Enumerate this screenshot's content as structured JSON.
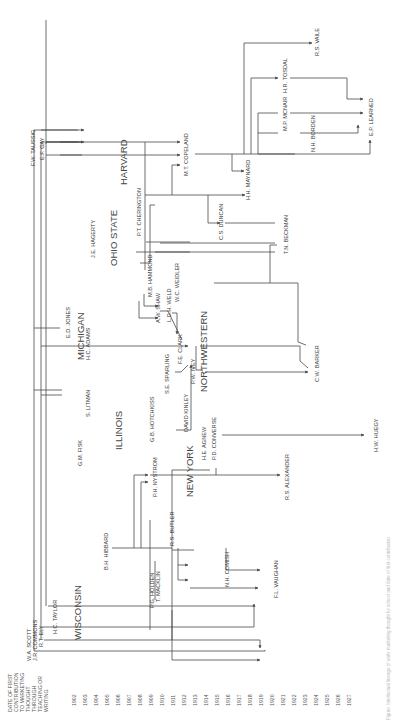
{
  "axis": {
    "heading": [
      "DATE OF FIRST",
      "CONTRIBUTION",
      "TO MARKETING",
      "THOUGHT",
      "THROUGH",
      "TEACHING OR",
      "WRITING"
    ],
    "years": [
      "1902",
      "1903",
      "1904",
      "1905",
      "1906",
      "1907",
      "1908",
      "1909",
      "1910",
      "1911",
      "1912",
      "1913",
      "1914",
      "1915",
      "1916",
      "1917",
      "1918",
      "1919",
      "1920",
      "1921",
      "1922",
      "1923",
      "1924",
      "1925",
      "1926",
      "1927"
    ]
  },
  "schools": {
    "wisconsin": "WISCONSIN",
    "illinois": "ILLINOIS",
    "new_york": "NEW YORK",
    "michigan": "MICHIGAN",
    "ohio_state": "OHIO STATE",
    "northwestern": "NORTHWESTERN",
    "harvard": "HARVARD"
  },
  "people": {
    "scott": "W.A. SCOTT",
    "commons": "J.R. COMMONS",
    "ely": "R.T. ELY",
    "taylor": "H.C. TAYLOR",
    "hibbard": "B.H. HIBBARD",
    "holden": "P.G. HOLDEN",
    "macklin": "T. MACKLIN",
    "comish": "N.H. COMISH",
    "vaughan": "F.L. VAUGHAN",
    "butler": "R.S. BUTLER",
    "nystrom": "P.H. NYSTROM",
    "agnew": "H.E. AGNEW",
    "converse": "P.D. CONVERSE",
    "alexander": "R.S. ALEXANDER",
    "fisk": "G.M. FISK",
    "litman": "S. LITMAN",
    "hotchkiss": "G.B. HOTCHKISS",
    "kinley": "DAVID KINLEY",
    "sparling": "S.E. SPARLING",
    "clark": "F.E. CLARK",
    "ivey": "P.W. IVEY",
    "huegy": "H.W. HUEGY",
    "jones": "E.D. JONES",
    "adams": "H.C. ADAMS",
    "shaw": "A.W. SHAW",
    "hammond": "M.B. HAMMOND",
    "weld": "L.D.H. WELD",
    "weidler": "W.C. WEIDLER",
    "barker": "C.W. BARKER",
    "hagerty": "J.E. HAGERTY",
    "cherington": "P.T. CHERINGTON",
    "duncan": "C.S. DUNCAN",
    "beckman": "T.N. BECKMAN",
    "taussig": "F.W. TAUSSIG",
    "gay": "E.F. GAY",
    "copeland": "M.T. COPELAND",
    "maynard": "H.H. MAYNARD",
    "mcnair": "M.P. MCNAIR",
    "tosdal": "H.R. TOSDAL",
    "borden": "N.H. BORDEN",
    "learned": "E.P. LEARNED",
    "vaile": "R.S. VAILE"
  },
  "caption": "Figure: Intellectual lineage of early marketing thought by school and date of first contribution"
}
